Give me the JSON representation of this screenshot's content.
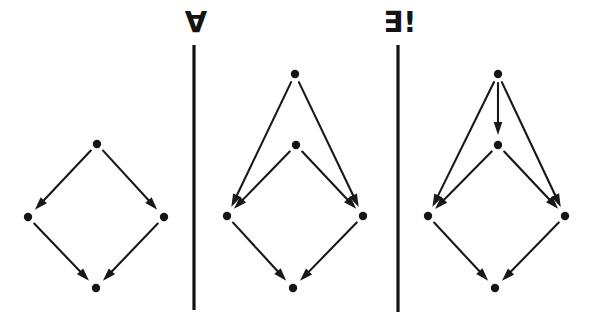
{
  "figure": {
    "background_color": "#ffffff",
    "ink_color": "#181818",
    "width": 600,
    "height": 318
  },
  "separators": [
    {
      "name": "divider-left",
      "x": 194,
      "y1": 45,
      "y2": 310,
      "color": "#131313"
    },
    {
      "name": "divider-right",
      "x": 398,
      "y1": 45,
      "y2": 312,
      "color": "#131313"
    }
  ],
  "quantifiers": [
    {
      "name": "for-all",
      "symbol": "∀",
      "x": 196,
      "y": 32
    },
    {
      "name": "exists-unique",
      "symbol": "∃!",
      "x": 400,
      "y": 32
    }
  ],
  "panels": [
    {
      "id": "panel-square",
      "label": "commutative-square",
      "nodes": [
        {
          "id": "top",
          "x": 97,
          "y": 144
        },
        {
          "id": "left",
          "x": 28,
          "y": 217
        },
        {
          "id": "right",
          "x": 164,
          "y": 217
        },
        {
          "id": "bottom",
          "x": 96,
          "y": 288
        }
      ],
      "edges": [
        {
          "from": "top",
          "to": "left"
        },
        {
          "from": "top",
          "to": "right"
        },
        {
          "from": "left",
          "to": "bottom"
        },
        {
          "from": "right",
          "to": "bottom"
        }
      ]
    },
    {
      "id": "panel-cone",
      "label": "cone-over-square",
      "nodes": [
        {
          "id": "apex",
          "x": 295,
          "y": 74
        },
        {
          "id": "top",
          "x": 296,
          "y": 145
        },
        {
          "id": "left",
          "x": 227,
          "y": 216
        },
        {
          "id": "right",
          "x": 363,
          "y": 216
        },
        {
          "id": "bottom",
          "x": 293,
          "y": 288
        }
      ],
      "edges": [
        {
          "from": "apex",
          "to": "left"
        },
        {
          "from": "apex",
          "to": "right"
        },
        {
          "from": "top",
          "to": "left"
        },
        {
          "from": "top",
          "to": "right"
        },
        {
          "from": "left",
          "to": "bottom"
        },
        {
          "from": "right",
          "to": "bottom"
        }
      ]
    },
    {
      "id": "panel-mediating",
      "label": "cone-with-unique-mediating-arrow",
      "nodes": [
        {
          "id": "apex",
          "x": 498,
          "y": 74
        },
        {
          "id": "top",
          "x": 498,
          "y": 145
        },
        {
          "id": "left",
          "x": 428,
          "y": 216
        },
        {
          "id": "right",
          "x": 565,
          "y": 216
        },
        {
          "id": "bottom",
          "x": 495,
          "y": 288
        }
      ],
      "edges": [
        {
          "from": "apex",
          "to": "left"
        },
        {
          "from": "apex",
          "to": "right"
        },
        {
          "from": "apex",
          "to": "top"
        },
        {
          "from": "top",
          "to": "left"
        },
        {
          "from": "top",
          "to": "right"
        },
        {
          "from": "left",
          "to": "bottom"
        },
        {
          "from": "right",
          "to": "bottom"
        }
      ]
    }
  ],
  "style": {
    "node_radius": 4.2,
    "edge_width": 2.1,
    "arrowhead_length": 13,
    "arrowhead_halfwidth": 4.3,
    "gap_from_source": 9,
    "gap_to_target": 10
  }
}
